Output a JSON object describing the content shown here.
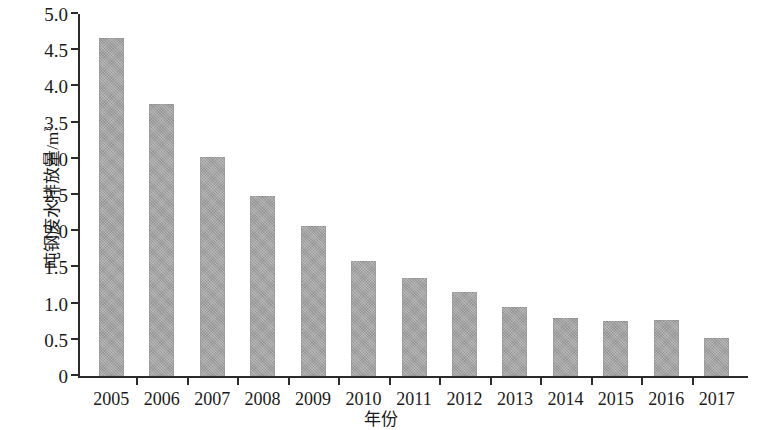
{
  "chart_data": {
    "type": "bar",
    "title": "",
    "xlabel": "年份",
    "ylabel": "吨钢废水排放量/m",
    "ylabel_superscript": "3",
    "ylabel_full": "吨钢废水排放量/m³",
    "categories": [
      "2005",
      "2006",
      "2007",
      "2008",
      "2009",
      "2010",
      "2011",
      "2012",
      "2013",
      "2014",
      "2015",
      "2016",
      "2017"
    ],
    "values": [
      4.67,
      3.76,
      3.02,
      2.49,
      2.07,
      1.59,
      1.35,
      1.16,
      0.95,
      0.8,
      0.76,
      0.78,
      0.53
    ],
    "series": [
      {
        "name": "吨钢废水排放量",
        "values": [
          4.67,
          3.76,
          3.02,
          2.49,
          2.07,
          1.59,
          1.35,
          1.16,
          0.95,
          0.8,
          0.76,
          0.78,
          0.53
        ]
      }
    ],
    "ylim": [
      0,
      5.0
    ],
    "ytick_values": [
      0,
      0.5,
      1.0,
      1.5,
      2.0,
      2.5,
      3.0,
      3.5,
      4.0,
      4.5,
      5.0
    ],
    "ytick_labels": [
      "0",
      "0.5",
      "1.0",
      "1.5",
      "2.0",
      "2.5",
      "3.0",
      "3.5",
      "4.0",
      "4.5",
      "5.0"
    ],
    "grid": false,
    "legend": null,
    "bar_color": "#a3a3a3",
    "axis_color": "#2b2b2b",
    "annotations": []
  }
}
